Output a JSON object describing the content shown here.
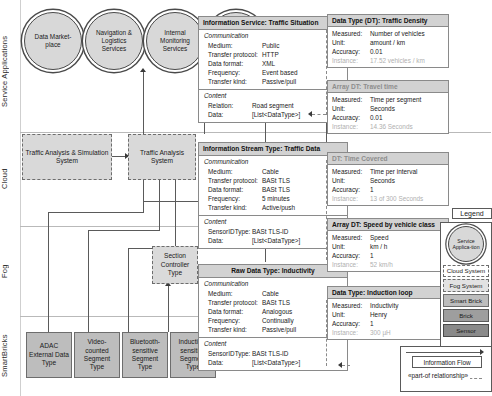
{
  "lanes": [
    {
      "id": "service",
      "label": "Service Applications"
    },
    {
      "id": "cloud",
      "label": "Cloud"
    },
    {
      "id": "fog",
      "label": "Fog"
    },
    {
      "id": "smartbricks",
      "label": "SmartBricks"
    }
  ],
  "service_applications": [
    {
      "name": "data-marketplace",
      "label": "Data Market-place"
    },
    {
      "name": "navigation-logistics",
      "label": "Navigation & Logistics Services"
    },
    {
      "name": "internal-monitoring",
      "label": "Internal Monitoring Services"
    },
    {
      "name": "public-monitoring",
      "label": "Public Monitoring Services"
    }
  ],
  "cloud_systems": [
    {
      "name": "traffic-analysis-simulation-system",
      "label": "Traffic Analysis & Simulation System"
    },
    {
      "name": "traffic-analysis-system",
      "label": "Traffic Analysis System"
    }
  ],
  "fog_systems": [
    {
      "name": "section-controller-type",
      "label": "Section Controller Type"
    }
  ],
  "smartbricks": [
    {
      "name": "adac-external-data-type",
      "label": "ADAC External Data Type"
    },
    {
      "name": "video-counted-segment-type",
      "label": "Video-counted Segment Type"
    },
    {
      "name": "bluetooth-sensitive-segment-type",
      "label": "Bluetooth-sensitive Segment Type"
    },
    {
      "name": "induction-sensitive-segment-type",
      "label": "Induction-sensitive Segment Type"
    }
  ],
  "cards": [
    {
      "name": "information-service-traffic-situation",
      "title": "Information Service: Traffic Situation",
      "comm_head": "Communication",
      "comm": [
        {
          "k": "Medium:",
          "v": "Public"
        },
        {
          "k": "Transfer protocol:",
          "v": "HTTP"
        },
        {
          "k": "Data format:",
          "v": "XML"
        },
        {
          "k": "Frequency:",
          "v": "Event based"
        },
        {
          "k": "Transfer kind:",
          "v": "Passive/pull"
        }
      ],
      "content_head": "Content",
      "content": [
        {
          "k": "Relation:",
          "v": "Road segment"
        },
        {
          "k": "Data:",
          "v": "[List<DataType>]"
        }
      ]
    },
    {
      "name": "information-stream-type-traffic-data",
      "title": "Information Stream Type: Traffic Data",
      "comm_head": "Communication",
      "comm": [
        {
          "k": "Medium:",
          "v": "Cable"
        },
        {
          "k": "Transfer protocol:",
          "v": "BASt TLS"
        },
        {
          "k": "Data format:",
          "v": "BASt TLS"
        },
        {
          "k": "Frequency:",
          "v": "5 minutes"
        },
        {
          "k": "Transfer kind:",
          "v": "Active/push"
        }
      ],
      "content_head": "Content",
      "content": [
        {
          "k": "SensorIDType:",
          "v": "BASt TLS-ID"
        },
        {
          "k": "Data:",
          "v": "[List<DataType>]"
        }
      ]
    },
    {
      "name": "raw-data-type-inductivity",
      "title": "Raw Data Type: Inductivity",
      "comm_head": "Communication",
      "comm": [
        {
          "k": "Medium:",
          "v": "Cable"
        },
        {
          "k": "Transfer protocol:",
          "v": "BASt TLS"
        },
        {
          "k": "Data format:",
          "v": "Analogous"
        },
        {
          "k": "Frequency:",
          "v": "Continually"
        },
        {
          "k": "Transfer kind:",
          "v": "Passive/pull"
        }
      ],
      "content_head": "Content",
      "content": [
        {
          "k": "SensorIDType:",
          "v": "BASt TLS-ID"
        },
        {
          "k": "Data:",
          "v": "[List<DataType>]"
        }
      ]
    }
  ],
  "data_types": [
    {
      "name": "data-type-traffic-density",
      "title": "Data Type (DT): Traffic Density",
      "title_grey": false,
      "rows": [
        {
          "k": "Measured:",
          "v": "Number of vehicles",
          "grey": false
        },
        {
          "k": "Unit:",
          "v": "amount / km",
          "grey": false
        },
        {
          "k": "Accuracy:",
          "v": "0.01",
          "grey": false
        },
        {
          "k": "Instance:",
          "v": "17.52 vehicles / km",
          "grey": true
        }
      ]
    },
    {
      "name": "array-data-type-travel-time",
      "title": "Array DT: Travel time",
      "title_grey": true,
      "rows": [
        {
          "k": "Measured:",
          "v": "Time per segment",
          "grey": false
        },
        {
          "k": "Unit:",
          "v": "Seconds",
          "grey": false
        },
        {
          "k": "Accuracy:",
          "v": "0.01",
          "grey": false
        },
        {
          "k": "Instance:",
          "v": "14.36 Seconds",
          "grey": true
        }
      ]
    },
    {
      "name": "data-type-time-covered",
      "title": "DT: Time Covered",
      "title_grey": true,
      "rows": [
        {
          "k": "Measured:",
          "v": "Time per interval",
          "grey": false
        },
        {
          "k": "Unit:",
          "v": "Seconds",
          "grey": false
        },
        {
          "k": "Accuracy:",
          "v": "1",
          "grey": false
        },
        {
          "k": "Instance:",
          "v": "13 of 300 Seconds",
          "grey": true
        }
      ]
    },
    {
      "name": "array-data-type-speed-by-vehicle-class",
      "title": "Array DT: Speed by vehicle class",
      "title_grey": false,
      "rows": [
        {
          "k": "Measured:",
          "v": "Speed",
          "grey": false
        },
        {
          "k": "Unit:",
          "v": "km / h",
          "grey": false
        },
        {
          "k": "Accuracy:",
          "v": "1",
          "grey": false
        },
        {
          "k": "Instance:",
          "v": "52 km/h",
          "grey": true
        }
      ]
    },
    {
      "name": "data-type-induction-loop",
      "title": "Data Type: Induction loop",
      "title_grey": false,
      "rows": [
        {
          "k": "Measured:",
          "v": "Inductivity",
          "grey": false
        },
        {
          "k": "Unit:",
          "v": "Henry",
          "grey": false
        },
        {
          "k": "Accuracy:",
          "v": "1",
          "grey": false
        },
        {
          "k": "Instance:",
          "v": "300 µH",
          "grey": true
        }
      ]
    }
  ],
  "legend": {
    "title": "Legend",
    "service_application": "Service Applica-tion",
    "items": [
      {
        "name": "legend-cloud-system",
        "label": "Cloud System",
        "style": "lg-cloud"
      },
      {
        "name": "legend-fog-system",
        "label": "Fog System",
        "style": "lg-fog"
      },
      {
        "name": "legend-smart-brick",
        "label": "Smart Brick",
        "style": "lg-smart"
      },
      {
        "name": "legend-brick",
        "label": "Brick",
        "style": "lg-brick"
      },
      {
        "name": "legend-sensor",
        "label": "Sensor",
        "style": "lg-sensor"
      }
    ],
    "information_flow": "Information Flow",
    "part_of_relationship": "«part-of relationship»"
  }
}
